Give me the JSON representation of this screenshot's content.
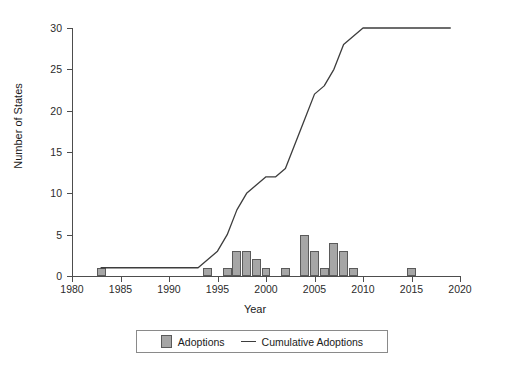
{
  "chart_data": {
    "type": "bar",
    "title": "",
    "xlabel": "Year",
    "ylabel": "Number of States",
    "xlim": [
      1980,
      2020
    ],
    "ylim": [
      0,
      30
    ],
    "xticks": [
      "1980",
      "1985",
      "1990",
      "1995",
      "2000",
      "2005",
      "2010",
      "2015",
      "2020"
    ],
    "yticks": [
      "0",
      "5",
      "10",
      "15",
      "20",
      "25",
      "30"
    ],
    "grid": false,
    "legend_position": "bottom-center",
    "series": [
      {
        "name": "Adoptions",
        "type": "bar",
        "color": "#a6a6a6",
        "x": [
          1983,
          1994,
          1996,
          1997,
          1998,
          1999,
          2000,
          2002,
          2004,
          2005,
          2006,
          2007,
          2008,
          2009,
          2015
        ],
        "values": [
          1,
          1,
          1,
          3,
          3,
          2,
          1,
          1,
          5,
          3,
          1,
          4,
          3,
          1,
          1
        ]
      },
      {
        "name": "Cumulative Adoptions",
        "type": "line",
        "color": "#3d3d3d",
        "x": [
          1983,
          1984,
          1985,
          1986,
          1987,
          1988,
          1989,
          1990,
          1991,
          1992,
          1993,
          1994,
          1995,
          1996,
          1997,
          1998,
          1999,
          2000,
          2001,
          2002,
          2003,
          2004,
          2005,
          2006,
          2007,
          2008,
          2009,
          2010,
          2011,
          2012,
          2013,
          2014,
          2015,
          2016,
          2017,
          2018,
          2019
        ],
        "values": [
          1,
          1,
          1,
          1,
          1,
          1,
          1,
          1,
          1,
          1,
          1,
          2,
          3,
          5,
          8,
          10,
          11,
          12,
          12,
          13,
          16,
          19,
          22,
          23,
          25,
          28,
          29,
          30,
          30,
          30,
          30,
          30,
          30,
          30,
          30,
          30,
          30
        ]
      }
    ]
  },
  "legend": {
    "adoptions_label": "Adoptions",
    "cumulative_label": "Cumulative Adoptions"
  }
}
